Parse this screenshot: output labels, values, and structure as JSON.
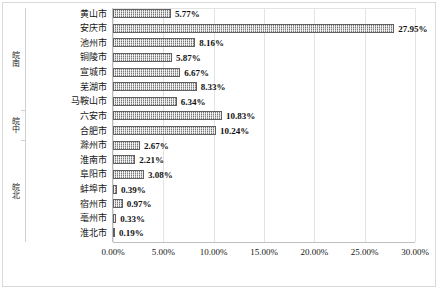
{
  "chart_data": {
    "type": "bar",
    "orientation": "horizontal",
    "title": "",
    "xlabel": "",
    "ylabel": "",
    "xlim": [
      0,
      0.3
    ],
    "grid": true,
    "legend": false,
    "value_format": "percent",
    "xticks": [
      "0.00%",
      "5.00%",
      "10.00%",
      "15.00%",
      "20.00%",
      "25.00%",
      "30.00%"
    ],
    "xtick_values": [
      0,
      5,
      10,
      15,
      20,
      25,
      30
    ],
    "groups": [
      {
        "label": "皖南",
        "count": 7
      },
      {
        "label": "皖中",
        "count": 2
      },
      {
        "label": "皖北",
        "count": 7
      }
    ],
    "categories": [
      "黄山市",
      "安庆市",
      "池州市",
      "铜陵市",
      "宣城市",
      "芜湖市",
      "马鞍山市",
      "六安市",
      "合肥市",
      "滁州市",
      "淮南市",
      "阜阳市",
      "蚌埠市",
      "宿州市",
      "亳州市",
      "淮北市"
    ],
    "values": [
      5.77,
      27.95,
      8.16,
      5.87,
      6.67,
      8.33,
      6.34,
      10.83,
      10.24,
      2.67,
      2.21,
      3.08,
      0.39,
      0.97,
      0.33,
      0.19
    ],
    "labels": [
      "5.77%",
      "27.95%",
      "8.16%",
      "5.87%",
      "6.67%",
      "8.33%",
      "6.34%",
      "10.83%",
      "10.24%",
      "2.67%",
      "2.21%",
      "3.08%",
      "0.39%",
      "0.97%",
      "0.33%",
      "0.19%"
    ],
    "series": [
      {
        "name": "占比",
        "values": [
          5.77,
          27.95,
          8.16,
          5.87,
          6.67,
          8.33,
          6.34,
          10.83,
          10.24,
          2.67,
          2.21,
          3.08,
          0.39,
          0.97,
          0.33,
          0.19
        ]
      }
    ],
    "colors": {
      "bar_fill": "#b8b8b8",
      "bar_border": "#606060",
      "gridline": "#e3e3e3",
      "axis_line": "#bfbfbf",
      "text": "#161616",
      "background": "#ffffff"
    }
  }
}
